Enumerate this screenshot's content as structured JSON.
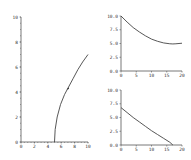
{
  "chart_data": [
    {
      "type": "line",
      "title": "",
      "xlabel": "",
      "ylabel": "",
      "xlim": [
        0,
        10
      ],
      "ylim": [
        0,
        10
      ],
      "x_ticks": [
        "0",
        "2",
        "4",
        "6",
        "8",
        "10"
      ],
      "y_ticks": [
        "0",
        "2",
        "4",
        "6",
        "8",
        "10"
      ],
      "grid": false,
      "series": [
        {
          "name": "trajectory",
          "x": [
            5.0,
            5.1,
            5.4,
            5.9,
            6.5,
            7.1,
            7.8,
            8.5,
            9.2,
            10.0
          ],
          "y": [
            0.0,
            1.0,
            2.0,
            3.0,
            3.8,
            4.4,
            5.1,
            5.8,
            6.4,
            7.0
          ]
        }
      ],
      "annotations": [
        {
          "type": "arrow-marker",
          "x": 7.0,
          "y": 4.3
        }
      ],
      "layout": {
        "px_x0": 21,
        "px_x1": 88,
        "px_y0": 142,
        "px_y1": 17
      }
    },
    {
      "type": "line",
      "title": "",
      "xlabel": "",
      "ylabel": "",
      "xlim": [
        0,
        20
      ],
      "ylim": [
        0,
        10
      ],
      "x_ticks": [
        "0",
        "5",
        "10",
        "15",
        "20"
      ],
      "y_ticks": [
        "0.0",
        "2.5",
        "5.0",
        "7.5",
        "10.0"
      ],
      "grid": false,
      "series": [
        {
          "name": "x(t)",
          "x": [
            0,
            2,
            4,
            6,
            8,
            10,
            12,
            14,
            16,
            17,
            18,
            20
          ],
          "y": [
            10.0,
            8.9,
            7.9,
            7.1,
            6.4,
            5.8,
            5.4,
            5.1,
            4.95,
            4.92,
            4.95,
            5.05
          ]
        }
      ],
      "layout": {
        "px_x0": 121,
        "px_x1": 182,
        "px_y0": 71,
        "px_y1": 16
      }
    },
    {
      "type": "line",
      "title": "",
      "xlabel": "",
      "ylabel": "",
      "xlim": [
        0,
        20
      ],
      "ylim": [
        0,
        10
      ],
      "x_ticks": [
        "0",
        "5",
        "10",
        "15",
        "20"
      ],
      "y_ticks": [
        "0.0",
        "2.5",
        "5.0",
        "7.5",
        "10.0"
      ],
      "grid": false,
      "series": [
        {
          "name": "y(t)",
          "x": [
            0,
            2,
            4,
            6,
            8,
            10,
            12,
            14,
            16,
            17
          ],
          "y": [
            6.8,
            5.9,
            5.0,
            4.2,
            3.4,
            2.6,
            1.9,
            1.2,
            0.5,
            0.0
          ]
        }
      ],
      "layout": {
        "px_x0": 121,
        "px_x1": 182,
        "px_y0": 145,
        "px_y1": 90
      }
    }
  ]
}
